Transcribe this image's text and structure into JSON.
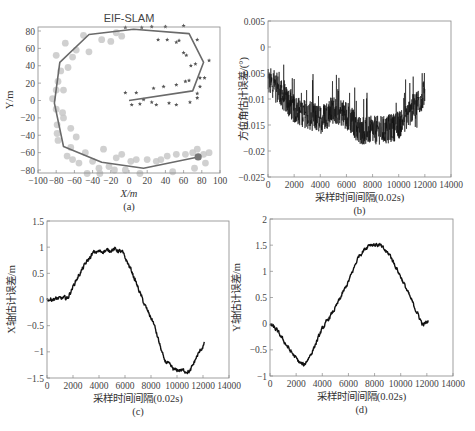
{
  "figure": {
    "panels": [
      "(a)",
      "(b)",
      "(c)",
      "(d)"
    ]
  },
  "chart_data": [
    {
      "id": "a",
      "type": "scatter",
      "title": "EIF-SLAM",
      "xlabel": "X/m",
      "ylabel": "Y/m",
      "caption": "(a)",
      "xlim": [
        -100,
        100
      ],
      "ylim": [
        -85,
        85
      ],
      "xticks": [
        -100,
        -80,
        -60,
        -40,
        -20,
        0,
        20,
        40,
        60,
        80,
        100
      ],
      "xtick_labels": [
        "−100",
        "−80",
        "−60",
        "−40",
        "−20",
        "0",
        "20",
        "40",
        "60",
        "80",
        "100"
      ],
      "yticks": [
        80,
        60,
        40,
        20,
        0,
        -20,
        -40,
        -60,
        -80
      ],
      "ytick_labels": [
        "80",
        "60",
        "40",
        "20",
        "0",
        "−20",
        "−40",
        "−60",
        "−80"
      ],
      "grid": false,
      "series": [
        {
          "name": "trajectory",
          "kind": "line",
          "color": "#6a6a6a",
          "points": [
            [
              0,
              0
            ],
            [
              70,
              11
            ],
            [
              82,
              44
            ],
            [
              66,
              77
            ],
            [
              5,
              82
            ],
            [
              -44,
              76
            ],
            [
              -76,
              44
            ],
            [
              -82,
              -3
            ],
            [
              -72,
              -53
            ],
            [
              -30,
              -71
            ],
            [
              16,
              -78
            ],
            [
              76,
              -65
            ]
          ]
        },
        {
          "name": "landmarks-observed",
          "kind": "star",
          "color": "#555555",
          "points": [
            [
              -4,
              9
            ],
            [
              8,
              9
            ],
            [
              27,
              14
            ],
            [
              38,
              16
            ],
            [
              52,
              18
            ],
            [
              62,
              22
            ],
            [
              66,
              23
            ],
            [
              68,
              40
            ],
            [
              73,
              42
            ],
            [
              63,
              52
            ],
            [
              60,
              55
            ],
            [
              75,
              70
            ],
            [
              55,
              69
            ],
            [
              52,
              67
            ],
            [
              42,
              70
            ],
            [
              32,
              70
            ],
            [
              60,
              86
            ],
            [
              40,
              85
            ],
            [
              25,
              85
            ],
            [
              14,
              84
            ],
            [
              -4,
              84
            ],
            [
              78,
              26
            ],
            [
              78,
              16
            ],
            [
              75,
              8
            ],
            [
              75,
              3
            ],
            [
              3,
              -5
            ],
            [
              12,
              -4
            ],
            [
              16,
              1
            ],
            [
              25,
              -2
            ],
            [
              30,
              -5
            ],
            [
              44,
              -3
            ],
            [
              52,
              -5
            ],
            [
              67,
              -2
            ],
            [
              83,
              26
            ],
            [
              88,
              46
            ]
          ]
        },
        {
          "name": "landmarks-estimated",
          "kind": "circle",
          "color": "#c8c8c8",
          "points": [
            [
              -50,
              75
            ],
            [
              -70,
              66
            ],
            [
              -62,
              50
            ],
            [
              -58,
              58
            ],
            [
              -80,
              52
            ],
            [
              -67,
              38
            ],
            [
              -75,
              34
            ],
            [
              -78,
              22
            ],
            [
              -80,
              12
            ],
            [
              -72,
              12
            ],
            [
              -84,
              2
            ],
            [
              -73,
              -14
            ],
            [
              -79,
              -28
            ],
            [
              -79,
              -38
            ],
            [
              -78,
              -46
            ],
            [
              -64,
              -32
            ],
            [
              -58,
              -42
            ],
            [
              -64,
              -54
            ],
            [
              -68,
              -64
            ],
            [
              -62,
              -68
            ],
            [
              -55,
              -72
            ],
            [
              -48,
              -60
            ],
            [
              -40,
              -70
            ],
            [
              -33,
              -78
            ],
            [
              -22,
              -76
            ],
            [
              -28,
              -56
            ],
            [
              -14,
              -66
            ],
            [
              -8,
              -62
            ],
            [
              2,
              -70
            ],
            [
              8,
              -68
            ],
            [
              20,
              -68
            ],
            [
              30,
              -70
            ],
            [
              35,
              -68
            ],
            [
              42,
              -64
            ],
            [
              52,
              -62
            ],
            [
              62,
              -62
            ],
            [
              70,
              -60
            ],
            [
              75,
              -56
            ],
            [
              82,
              -62
            ],
            [
              88,
              -60
            ],
            [
              84,
              -72
            ],
            [
              72,
              -78
            ],
            [
              -4,
              -80
            ],
            [
              -16,
              -80
            ],
            [
              -32,
              -84
            ],
            [
              -46,
              -84
            ],
            [
              -30,
              70
            ],
            [
              -14,
              78
            ],
            [
              -20,
              68
            ],
            [
              -8,
              74
            ],
            [
              -44,
              56
            ],
            [
              -72,
              -20
            ],
            [
              -80,
              -10
            ],
            [
              12,
              -84
            ],
            [
              48,
              -82
            ]
          ]
        },
        {
          "name": "robot-position",
          "kind": "marker",
          "color": "#777777",
          "points": [
            [
              76,
              -65
            ]
          ]
        }
      ]
    },
    {
      "id": "b",
      "type": "line",
      "title": "",
      "xlabel": "采样时间间隔(0.02s)",
      "ylabel": "方位角估计误差/(°)",
      "caption": "(b)",
      "xlim": [
        0,
        14000
      ],
      "ylim": [
        -0.025,
        0.005
      ],
      "xticks": [
        0,
        2000,
        4000,
        6000,
        8000,
        10000,
        12000,
        14000
      ],
      "yticks": [
        0.005,
        0,
        -0.005,
        -0.01,
        -0.015,
        -0.02,
        -0.025
      ],
      "ytick_labels": [
        "0.005",
        "0",
        "−0.005",
        "−0.01",
        "−0.015",
        "−0.02",
        "−0.025"
      ],
      "grid": false,
      "series": [
        {
          "name": "heading-error",
          "color": "#111111",
          "noisy": true,
          "noise_amplitude": 0.004,
          "trend_x": [
            0,
            500,
            1000,
            2000,
            3000,
            4000,
            5000,
            6000,
            7000,
            8000,
            9000,
            10000,
            11000,
            12000
          ],
          "trend_y": [
            -0.007,
            -0.007,
            -0.009,
            -0.012,
            -0.013,
            -0.014,
            -0.012,
            -0.013,
            -0.016,
            -0.016,
            -0.016,
            -0.015,
            -0.012,
            -0.009
          ]
        }
      ]
    },
    {
      "id": "c",
      "type": "line",
      "title": "",
      "xlabel": "采样时间间隔(0.02s)",
      "ylabel": "X轴估计误差/m",
      "caption": "(c)",
      "xlim": [
        0,
        14000
      ],
      "ylim": [
        -1.5,
        1.5
      ],
      "xticks": [
        0,
        2000,
        4000,
        6000,
        8000,
        10000,
        12000,
        14000
      ],
      "yticks": [
        1.5,
        1,
        0.5,
        0,
        -0.5,
        -1,
        -1.5
      ],
      "ytick_labels": [
        "1.5",
        "1",
        "0.5",
        "0",
        "−0.5",
        "−1",
        "−1.5"
      ],
      "grid": false,
      "series": [
        {
          "name": "x-error",
          "color": "#111111",
          "noisy": true,
          "noise_amplitude": 0.03,
          "trend_x": [
            0,
            1600,
            2200,
            3000,
            3600,
            4500,
            5200,
            5800,
            6500,
            7500,
            8200,
            9000,
            9800,
            10300,
            11000,
            11500,
            12100
          ],
          "trend_y": [
            0,
            0.03,
            0.35,
            0.7,
            0.9,
            0.93,
            0.96,
            0.9,
            0.55,
            -0.1,
            -0.45,
            -1.15,
            -1.35,
            -1.35,
            -1.38,
            -1.1,
            -0.85
          ]
        }
      ]
    },
    {
      "id": "d",
      "type": "line",
      "title": "",
      "xlabel": "采样时间间隔(0.02s)",
      "ylabel": "Y轴估计误差/m",
      "caption": "(d)",
      "xlim": [
        0,
        14000
      ],
      "ylim": [
        -1,
        2
      ],
      "xticks": [
        0,
        2000,
        4000,
        6000,
        8000,
        10000,
        12000,
        14000
      ],
      "yticks": [
        2,
        1.5,
        1,
        0.5,
        0,
        -0.5,
        -1
      ],
      "ytick_labels": [
        "2",
        "1.5",
        "1",
        "0.5",
        "0",
        "−0.5",
        "−1"
      ],
      "grid": false,
      "series": [
        {
          "name": "y-error",
          "color": "#111111",
          "noisy": true,
          "noise_amplitude": 0.03,
          "trend_x": [
            0,
            500,
            1500,
            2200,
            2600,
            3200,
            4000,
            5000,
            6000,
            6800,
            7600,
            8400,
            9200,
            10000,
            11000,
            11700,
            12100
          ],
          "trend_y": [
            0,
            -0.12,
            -0.5,
            -0.73,
            -0.8,
            -0.55,
            -0.1,
            0.3,
            0.8,
            1.3,
            1.52,
            1.5,
            1.3,
            0.9,
            0.35,
            -0.03,
            0.05
          ]
        }
      ]
    }
  ],
  "layout": {
    "panels": {
      "a": {
        "left": 38,
        "top": 27,
        "right": 220,
        "bottom": 173,
        "ymap": [
          80,
          31,
          -80,
          170
        ]
      },
      "b": {
        "left": 268,
        "top": 21,
        "right": 451,
        "bottom": 177
      },
      "c": {
        "left": 47,
        "top": 221,
        "right": 229,
        "bottom": 378
      },
      "d": {
        "left": 270,
        "top": 219,
        "right": 453,
        "bottom": 376
      }
    }
  }
}
